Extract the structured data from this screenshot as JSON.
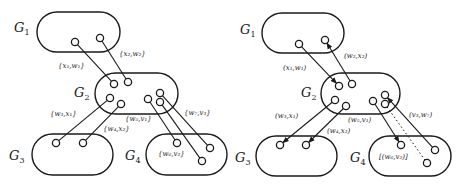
{
  "figure": {
    "panels": [
      {
        "id": "left",
        "groups": [
          {
            "name": "G",
            "sub": "1",
            "label_x": 14,
            "label_y": 32,
            "x": 37,
            "y": 12,
            "w": 83,
            "h": 40
          },
          {
            "name": "G",
            "sub": "2",
            "label_x": 74,
            "label_y": 97,
            "x": 95,
            "y": 73,
            "w": 83,
            "h": 41
          },
          {
            "name": "G",
            "sub": "3",
            "label_x": 9,
            "label_y": 160,
            "x": 32,
            "y": 134,
            "w": 81,
            "h": 41
          },
          {
            "name": "G",
            "sub": "4",
            "label_x": 125,
            "label_y": 160,
            "x": 146,
            "y": 134,
            "w": 81,
            "h": 41
          }
        ],
        "nodes": [
          {
            "id": "g1a",
            "x": 75,
            "y": 42
          },
          {
            "id": "g1b",
            "x": 100,
            "y": 38
          },
          {
            "id": "g2a",
            "x": 114,
            "y": 84
          },
          {
            "id": "g2b",
            "x": 128,
            "y": 82
          },
          {
            "id": "g2c",
            "x": 110,
            "y": 98
          },
          {
            "id": "g2d",
            "x": 121,
            "y": 104
          },
          {
            "id": "g2e",
            "x": 148,
            "y": 99
          },
          {
            "id": "g2f",
            "x": 160,
            "y": 93
          },
          {
            "id": "g2g",
            "x": 160,
            "y": 102
          },
          {
            "id": "g3a",
            "x": 56,
            "y": 143
          },
          {
            "id": "g3b",
            "x": 83,
            "y": 143
          },
          {
            "id": "g4a",
            "x": 177,
            "y": 143
          },
          {
            "id": "g4b",
            "x": 210,
            "y": 148
          },
          {
            "id": "g4c",
            "x": 202,
            "y": 161
          }
        ],
        "edges": [
          {
            "from": "g1a",
            "to": "g2a",
            "style": "solid",
            "arrow": "none"
          },
          {
            "from": "g1b",
            "to": "g2b",
            "style": "solid",
            "arrow": "none"
          },
          {
            "from": "g2c",
            "to": "g3a",
            "style": "solid",
            "arrow": "none"
          },
          {
            "from": "g2d",
            "to": "g3b",
            "style": "solid",
            "arrow": "none"
          },
          {
            "from": "g2e",
            "to": "g4a",
            "style": "solid",
            "arrow": "none"
          },
          {
            "from": "g2f",
            "to": "g4b",
            "style": "solid",
            "arrow": "none"
          },
          {
            "from": "g2g",
            "to": "g4c",
            "style": "solid",
            "arrow": "none"
          }
        ],
        "edge_labels": [
          {
            "text": "{x₁,w₁}",
            "x": 58,
            "y": 68
          },
          {
            "text": "{x₂,w₂}",
            "x": 119,
            "y": 56
          },
          {
            "text": "{w₃,x₁}",
            "x": 50,
            "y": 116
          },
          {
            "text": "{w₄,x₂}",
            "x": 103,
            "y": 131
          },
          {
            "text": "{w₅,v₁}",
            "x": 125,
            "y": 121
          },
          {
            "text": "{w₇,v₃}",
            "x": 184,
            "y": 115
          },
          {
            "text": "{w₆,v₂}",
            "x": 158,
            "y": 156
          }
        ]
      },
      {
        "id": "right",
        "groups": [
          {
            "name": "G",
            "sub": "1",
            "label_x": 240,
            "label_y": 34,
            "x": 262,
            "y": 13,
            "w": 82,
            "h": 40
          },
          {
            "name": "G",
            "sub": "2",
            "label_x": 301,
            "label_y": 97,
            "x": 321,
            "y": 73,
            "w": 79,
            "h": 41
          },
          {
            "name": "G",
            "sub": "3",
            "label_x": 235,
            "label_y": 162,
            "x": 256,
            "y": 136,
            "w": 81,
            "h": 40
          },
          {
            "name": "G",
            "sub": "4",
            "label_x": 350,
            "label_y": 162,
            "x": 369,
            "y": 136,
            "w": 82,
            "h": 40
          }
        ],
        "nodes": [
          {
            "id": "g1a",
            "x": 299,
            "y": 44
          },
          {
            "id": "g1b",
            "x": 325,
            "y": 40
          },
          {
            "id": "g2a",
            "x": 339,
            "y": 86
          },
          {
            "id": "g2b",
            "x": 352,
            "y": 84
          },
          {
            "id": "g2c",
            "x": 335,
            "y": 100
          },
          {
            "id": "g2d",
            "x": 346,
            "y": 106
          },
          {
            "id": "g2e",
            "x": 373,
            "y": 101
          },
          {
            "id": "g2f",
            "x": 385,
            "y": 95
          },
          {
            "id": "g2g",
            "x": 385,
            "y": 104
          },
          {
            "id": "g3a",
            "x": 280,
            "y": 145
          },
          {
            "id": "g3b",
            "x": 306,
            "y": 145
          },
          {
            "id": "g4a",
            "x": 401,
            "y": 145
          },
          {
            "id": "g4b",
            "x": 435,
            "y": 150
          },
          {
            "id": "g4c",
            "x": 427,
            "y": 163
          }
        ],
        "edges": [
          {
            "from": "g1a",
            "to": "g2a",
            "style": "solid",
            "arrow": "end"
          },
          {
            "from": "g2b",
            "to": "g1b",
            "style": "solid",
            "arrow": "end"
          },
          {
            "from": "g2c",
            "to": "g3a",
            "style": "solid",
            "arrow": "end"
          },
          {
            "from": "g2d",
            "to": "g3b",
            "style": "solid",
            "arrow": "end"
          },
          {
            "from": "g2e",
            "to": "g4a",
            "style": "solid",
            "arrow": "end"
          },
          {
            "from": "g4b",
            "to": "g2f",
            "style": "solid",
            "arrow": "end"
          },
          {
            "from": "g2g",
            "to": "g4c",
            "style": "dotted",
            "arrow": "none"
          }
        ],
        "edge_labels": [
          {
            "text": "(x₁,w₁)",
            "x": 283,
            "y": 70
          },
          {
            "text": "(w₂,x₂)",
            "x": 344,
            "y": 58
          },
          {
            "text": "(w₃,x₁)",
            "x": 275,
            "y": 118
          },
          {
            "text": "(w₄,x₂)",
            "x": 327,
            "y": 133
          },
          {
            "text": "(w₅,v₁)",
            "x": 348,
            "y": 122
          },
          {
            "text": "(v₃,w₇)",
            "x": 409,
            "y": 117
          },
          {
            "text": "[(w₆,v₂)]",
            "x": 379,
            "y": 159
          }
        ]
      }
    ]
  }
}
